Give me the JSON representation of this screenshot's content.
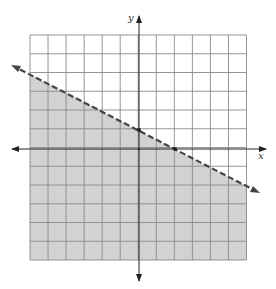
{
  "graph": {
    "title": "",
    "axis_labels": {
      "x": "x",
      "y": "y"
    },
    "grid": {
      "xmin": -6,
      "xmax": 6,
      "ymin": -6,
      "ymax": 6,
      "step": 1
    },
    "boundary_line": {
      "equation": "y = -1/2 x + 1",
      "style": "dashed",
      "marked_points": [
        [
          0,
          1
        ],
        [
          2,
          0
        ]
      ]
    },
    "shaded_region": "below line",
    "inequality": "y < -1/2 x + 1",
    "colors": {
      "shade": "#d2d2d2",
      "grid": "#8a8a8a",
      "axis": "#222222",
      "line": "#444444"
    }
  },
  "chart_data": {
    "type": "line",
    "title": "",
    "xlabel": "x",
    "ylabel": "y",
    "xlim": [
      -6,
      6
    ],
    "ylim": [
      -6,
      6
    ],
    "grid": true,
    "series": [
      {
        "name": "boundary (dashed)",
        "x": [
          -7.5,
          0,
          2,
          6.5
        ],
        "y": [
          4.5,
          1,
          0,
          -2.25
        ]
      }
    ],
    "shaded": "region below the dashed line (y < -x/2 + 1)"
  }
}
